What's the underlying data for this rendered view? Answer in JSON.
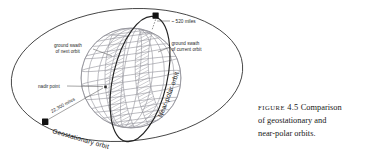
{
  "figure": {
    "caption": {
      "label": "FIGURE",
      "number": "4.5",
      "line1_rest": "Comparison",
      "line2": "of geostationary and",
      "line3": "near-polar orbits."
    },
    "annotations": {
      "altitude_near_polar": "~ 520 miles",
      "altitude_geostationary": "22,300 miles",
      "swath_next": "ground swath",
      "swath_next_2": "of next orbit",
      "swath_current": "ground swath",
      "swath_current_2": "of current orbit",
      "nadir": "nadir point",
      "geostationary_orbit": "Geostationary orbit",
      "near_polar_orbit": "Near-polar orbit"
    },
    "colors": {
      "ink": "#1a1a1a",
      "globe_grid": "#8d8d95",
      "orbit_line": "#2a2a2a",
      "swath_fill": "#b9b9bf",
      "satellite": "#111111",
      "background": "#ffffff"
    }
  }
}
